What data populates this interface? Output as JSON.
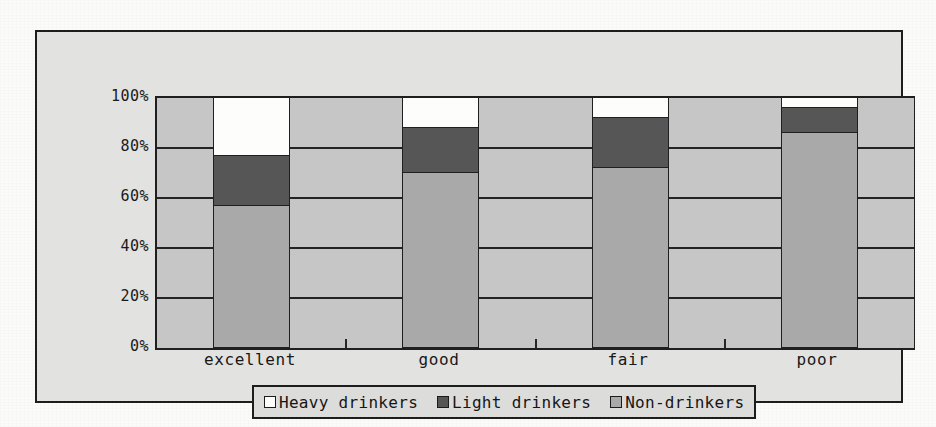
{
  "chart_data": {
    "type": "bar",
    "subtype": "stacked-percent",
    "title": "",
    "xlabel": "",
    "ylabel": "",
    "categories": [
      "excellent",
      "good",
      "fair",
      "poor"
    ],
    "ylim": [
      0,
      100
    ],
    "ytick_labels": [
      "100%",
      "80%",
      "60%",
      "40%",
      "20%",
      "0%"
    ],
    "ytick_values": [
      100,
      80,
      60,
      40,
      20,
      0
    ],
    "grid": true,
    "legend_position": "bottom",
    "series": [
      {
        "name": "Heavy drinkers",
        "color": "#fdfdfb",
        "values": [
          23,
          12,
          8,
          4
        ]
      },
      {
        "name": "Light drinkers",
        "color": "#565656",
        "values": [
          20,
          18,
          20,
          10
        ]
      },
      {
        "name": "Non-drinkers",
        "color": "#a9a9a9",
        "values": [
          57,
          70,
          72,
          86
        ]
      }
    ],
    "stack_tops": {
      "Non-drinkers": [
        57,
        70,
        72,
        86
      ],
      "Light drinkers": [
        77,
        88,
        92,
        96
      ],
      "Heavy drinkers": [
        100,
        100,
        100,
        100
      ]
    }
  },
  "axis": {
    "y_ticks": [
      {
        "label": "100%",
        "value": 100
      },
      {
        "label": "80%",
        "value": 80
      },
      {
        "label": "60%",
        "value": 60
      },
      {
        "label": "40%",
        "value": 40
      },
      {
        "label": "20%",
        "value": 20
      },
      {
        "label": "0%",
        "value": 0
      }
    ],
    "x_ticks": [
      {
        "label": "excellent"
      },
      {
        "label": "good"
      },
      {
        "label": "fair"
      },
      {
        "label": "poor"
      }
    ]
  },
  "legend": {
    "items": [
      {
        "label": "Heavy drinkers",
        "color": "#fdfdfb"
      },
      {
        "label": "Light drinkers",
        "color": "#565656"
      },
      {
        "label": "Non-drinkers",
        "color": "#a9a9a9"
      }
    ]
  },
  "colors": {
    "plot_background": "#c6c6c6",
    "frame_background": "#e2e2e0",
    "page_background": "#fbfbfa",
    "gridline": "#232323",
    "border": "#1d1d1d"
  }
}
